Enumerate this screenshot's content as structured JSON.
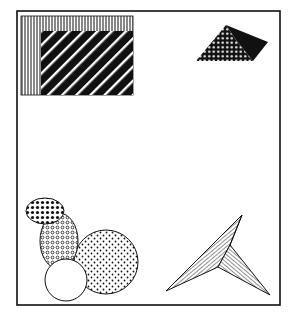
{
  "canvas": {
    "width": 295,
    "height": 320,
    "background": "#ffffff"
  },
  "colors": {
    "ink": "#111111",
    "paper": "#ffffff"
  },
  "frame": {
    "x": 17,
    "y": 11,
    "width": 263,
    "height": 294
  },
  "shapes": {
    "nested_rectangles": {
      "outer": {
        "x": 21,
        "y": 16,
        "width": 112,
        "height": 79,
        "fill": "vertical-lines"
      },
      "inner": {
        "x": 41,
        "y": 31,
        "width": 92,
        "height": 64,
        "fill": "white-diagonal-stripes-on-black"
      }
    },
    "quadrilateral": {
      "points": [
        [
          196,
          61
        ],
        [
          226,
          25
        ],
        [
          268,
          42
        ],
        [
          253,
          61
        ]
      ],
      "split_point": [
        236,
        40
      ],
      "left_fill": "white-dots-on-black",
      "right_fill": "solid-black"
    },
    "ellipse_cluster": [
      {
        "name": "small-ellipse",
        "cx": 45,
        "cy": 211,
        "rx": 19,
        "ry": 13,
        "fill": "black-dots"
      },
      {
        "name": "tall-ellipse",
        "cx": 59,
        "cy": 241,
        "rx": 19,
        "ry": 28,
        "fill": "small-rings"
      },
      {
        "name": "large-circle",
        "cx": 106,
        "cy": 262,
        "rx": 32,
        "ry": 32,
        "fill": "sparse-dots"
      },
      {
        "name": "white-circle",
        "cx": 66,
        "cy": 280,
        "rx": 21,
        "ry": 21,
        "fill": "white"
      }
    ],
    "arrowhead": {
      "tip": [
        242,
        215
      ],
      "left": [
        166,
        291
      ],
      "inner": [
        218,
        267
      ],
      "right": [
        270,
        295
      ],
      "notch": [
        230,
        245
      ],
      "left_fill": "fine-diagonal-hatch",
      "right_fill": "fine-reverse-hatch"
    }
  }
}
